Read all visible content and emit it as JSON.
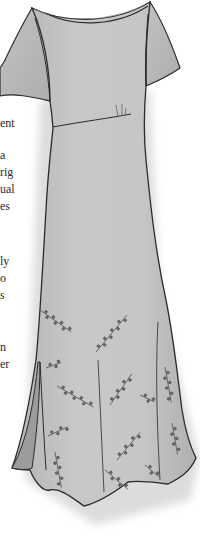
{
  "illustration": {
    "subject": "dress-illustration",
    "description": "Short-sleeved empire-waist maxi dress with flared trumpet hem, side slit, and leaf-sprig embroidery on the skirt",
    "colors": {
      "fabric": "#c4c4c4",
      "fabric_light": "#d2d2d2",
      "fabric_shadow": "#a8a8a8",
      "slit_inner": "#9c9c9c",
      "outline": "#2b2b2b",
      "embroidery": "#555555",
      "background": "#ffffff"
    }
  },
  "text_fragments": [
    {
      "text": "ent",
      "top": 116
    },
    {
      "text": "a",
      "top": 148
    },
    {
      "text": "rig",
      "top": 165
    },
    {
      "text": "ual",
      "top": 182
    },
    {
      "text": "es",
      "top": 199
    },
    {
      "text": "ly",
      "top": 254
    },
    {
      "text": "o",
      "top": 271
    },
    {
      "text": "s",
      "top": 288
    },
    {
      "text": "n",
      "top": 340
    },
    {
      "text": "er",
      "top": 357
    }
  ]
}
